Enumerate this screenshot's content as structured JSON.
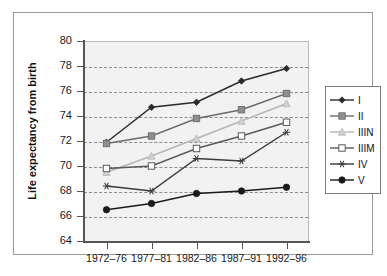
{
  "chart_data": {
    "type": "line",
    "title": "",
    "xlabel": "",
    "ylabel": "Life expectancy from birth",
    "categories": [
      "1972–76",
      "1977–81",
      "1982–86",
      "1987–91",
      "1992–96"
    ],
    "ylim": [
      64,
      80
    ],
    "yticks": [
      64,
      66,
      68,
      70,
      72,
      74,
      76,
      78,
      80
    ],
    "grid": true,
    "legend_position": "right",
    "series": [
      {
        "name": "I",
        "marker": "diamond",
        "color": "#2b2b2b",
        "marker_fill": "#2b2b2b",
        "values": [
          71.9,
          74.7,
          75.1,
          76.8,
          77.8
        ]
      },
      {
        "name": "II",
        "marker": "square",
        "color": "#6b6b6b",
        "marker_fill": "#8f8f8f",
        "values": [
          71.8,
          72.4,
          73.8,
          74.5,
          75.8
        ]
      },
      {
        "name": "IIIN",
        "marker": "triangle",
        "color": "#b5b5b5",
        "marker_fill": "#d2d2d2",
        "values": [
          69.5,
          70.8,
          72.2,
          73.6,
          75.0
        ]
      },
      {
        "name": "IIIM",
        "marker": "open-square",
        "color": "#5a5a5a",
        "marker_fill": "#ffffff",
        "values": [
          69.8,
          70.0,
          71.4,
          72.4,
          73.5
        ]
      },
      {
        "name": "IV",
        "marker": "asterisk",
        "color": "#3a3a3a",
        "marker_fill": "#3a3a3a",
        "values": [
          68.4,
          68.0,
          70.6,
          70.4,
          72.7
        ]
      },
      {
        "name": "V",
        "marker": "circle",
        "color": "#1a1a1a",
        "marker_fill": "#1a1a1a",
        "values": [
          66.5,
          67.0,
          67.8,
          68.0,
          68.3
        ]
      }
    ]
  },
  "legend": {
    "items": [
      {
        "label": "I"
      },
      {
        "label": "II"
      },
      {
        "label": "IIIN"
      },
      {
        "label": "IIIM"
      },
      {
        "label": "IV"
      },
      {
        "label": "V"
      }
    ]
  },
  "colors": {
    "plot_background": "#f2f2f2",
    "gridline": "#8d8d8d",
    "axis": "#555555",
    "frame": "#9a9a9a",
    "page_background": "#ffffff"
  }
}
